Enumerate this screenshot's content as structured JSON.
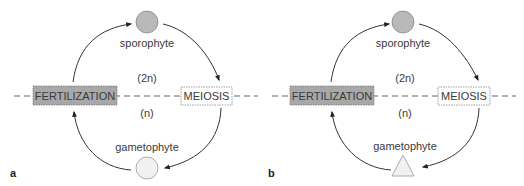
{
  "panels": [
    {
      "letter": "a",
      "sporophyte": "sporophyte",
      "diploid": "(2n)",
      "haploid": "(n)",
      "fertilization": "FERTILIZATION",
      "meiosis": "MEIOSIS",
      "gametophyte": "gametophyte",
      "gametophyte_shape": "circle"
    },
    {
      "letter": "b",
      "sporophyte": "sporophyte",
      "diploid": "(2n)",
      "haploid": "(n)",
      "fertilization": "FERTILIZATION",
      "meiosis": "MEIOSIS",
      "gametophyte": "gametophyte",
      "gametophyte_shape": "triangle"
    }
  ],
  "colors": {
    "sporophyte_fill": "#b9b9b9",
    "gametophyte_fill": "#f1f1f1",
    "fertilization_fill": "#a8a8a8",
    "meiosis_fill": "#ffffff",
    "line": "#333333"
  }
}
